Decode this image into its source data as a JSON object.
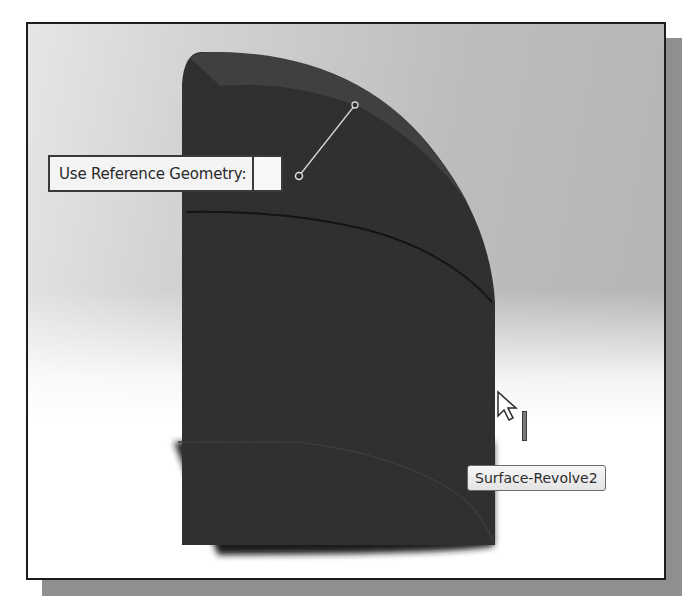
{
  "viewport": {
    "background_top_left": "#e6e6e6",
    "background_top_right": "#b4b4b4",
    "background_bottom": "#ffffff",
    "frame_border": "#1e1e1e",
    "frame_shadow": "#8f8f8f"
  },
  "model": {
    "name": "Surface-Revolve2",
    "body_color": "#2b2b2b",
    "top_face_color": "#3a3a3a",
    "seam_color": "#141414"
  },
  "callout": {
    "label": "Use Reference Geometry:",
    "input_value": ""
  },
  "tooltip": {
    "text": "Surface-Revolve2"
  },
  "cursor": {
    "icon": "arrow-cursor-icon",
    "secondary_icon": "surface-select-icon"
  }
}
